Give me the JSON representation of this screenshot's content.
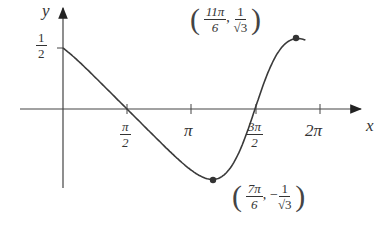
{
  "chart_data": {
    "type": "line",
    "title": "",
    "function_shape": "cos(x)/(2+sin(x))",
    "xlabel": "x",
    "ylabel": "y",
    "x_ticks": [
      {
        "value": 1.5708,
        "label": "π/2"
      },
      {
        "value": 3.1416,
        "label": "π"
      },
      {
        "value": 4.7124,
        "label": "3π/2"
      },
      {
        "value": 6.2832,
        "label": "2π"
      }
    ],
    "y_ticks": [
      {
        "value": 0.5,
        "label": "1/2"
      }
    ],
    "x_range": [
      0,
      6.2832
    ],
    "y_range": [
      -0.577,
      0.577
    ],
    "grid": false,
    "legend": null,
    "points": [
      {
        "x": 0,
        "y": 0.5
      },
      {
        "x": 1.5708,
        "y": 0
      },
      {
        "x": 3.6652,
        "y": -0.5774,
        "label": "(7π/6, −1/√3)",
        "marked": true
      },
      {
        "x": 4.7124,
        "y": 0
      },
      {
        "x": 5.7596,
        "y": 0.5774,
        "label": "(11π/6, 1/√3)",
        "marked": true
      },
      {
        "x": 6.2832,
        "y": 0.5
      }
    ],
    "annotations": [
      {
        "text": "(11π/6, 1/√3)",
        "at": "local maximum"
      },
      {
        "text": "(7π/6, −1/√3)",
        "at": "local minimum"
      }
    ]
  },
  "labels": {
    "y_axis": "y",
    "x_axis": "x",
    "y_half_num": "1",
    "y_half_den": "2",
    "pi_half_num": "π",
    "pi_half_den": "2",
    "pi": "π",
    "three_pi_half_num": "3π",
    "three_pi_half_den": "2",
    "two_pi": "2π",
    "max_x_num": "11π",
    "max_x_den": "6",
    "max_y_num": "1",
    "max_y_den": "√3",
    "min_x_num": "7π",
    "min_x_den": "6",
    "min_y_sign": "−",
    "min_y_num": "1",
    "min_y_den": "√3",
    "comma": ",",
    "lparen": "(",
    "rparen": ")"
  }
}
